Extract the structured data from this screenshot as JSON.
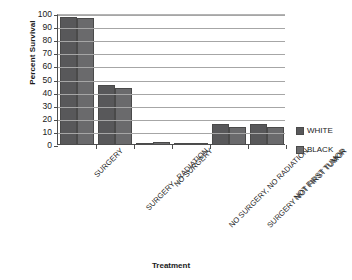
{
  "chart_data": {
    "type": "bar",
    "title": "",
    "xlabel": "Treatment",
    "ylabel": "Percent Survival",
    "ylim": [
      0,
      100
    ],
    "ytick_step": 10,
    "yticks": [
      100,
      90,
      80,
      70,
      60,
      50,
      40,
      30,
      20,
      10,
      0
    ],
    "grid": true,
    "legend_position": "right",
    "categories": [
      "SURGERY",
      "SURGERY , RADIATION",
      "NO SURGERY",
      "NO SURGERY, NO RADIATION",
      "SURGERY NOT FIRST TUMOR",
      "NOT FIRST TUMOR"
    ],
    "series": [
      {
        "name": "WHITE",
        "color": "#58585a",
        "values": [
          98,
          46,
          1,
          1,
          16,
          16
        ]
      },
      {
        "name": "BLACK",
        "color": "#6a6a6c",
        "values": [
          97,
          43.5,
          2,
          1.5,
          14,
          14
        ]
      }
    ]
  },
  "legend": {
    "items": [
      {
        "label": "WHITE"
      },
      {
        "label": "BLACK"
      }
    ]
  }
}
